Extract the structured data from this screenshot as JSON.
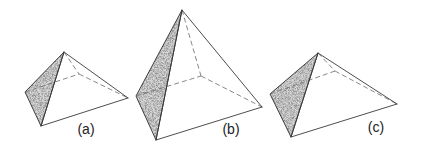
{
  "figure": {
    "shade_color": "#7a7a7a",
    "line_color": "#3a3a3a",
    "pyramids": [
      {
        "label": "(a)",
        "apex": [
          64,
          52
        ],
        "left": [
          25,
          92
        ],
        "front": [
          41,
          126
        ],
        "right": [
          128,
          98
        ],
        "back": [
          79,
          74
        ],
        "label_pos": [
          86,
          134
        ]
      },
      {
        "label": "(b)",
        "apex": [
          182,
          10
        ],
        "left": [
          136,
          96
        ],
        "front": [
          156,
          140
        ],
        "right": [
          262,
          107
        ],
        "back": [
          201,
          76
        ],
        "label_pos": [
          231,
          134
        ]
      },
      {
        "label": "(c)",
        "apex": [
          318,
          53
        ],
        "left": [
          270,
          94
        ],
        "front": [
          291,
          137
        ],
        "right": [
          397,
          104
        ],
        "back": [
          335,
          71
        ],
        "label_pos": [
          376,
          132
        ]
      }
    ]
  }
}
